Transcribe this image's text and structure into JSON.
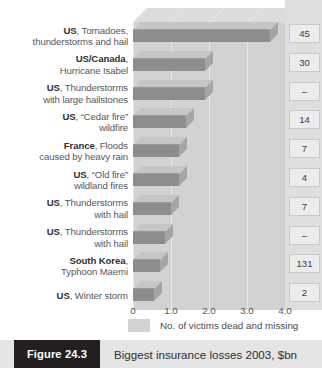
{
  "figure": {
    "tag": "Figure 24.3",
    "title": "Biggest insurance losses 2003, $bn"
  },
  "legend": {
    "swatch_label": "No. of victims dead and missing",
    "swatch_color": "#d2d2d2"
  },
  "colors": {
    "bar_face": "#8d8d8d",
    "bar_top": "#c6c6c6",
    "bar_side": "#a5a5a5",
    "plot_bg": "#d2d2d2",
    "value_col_bg": "#dedede",
    "value_box_bg": "#ececec",
    "caption_bg": "#e4e4e4",
    "tag_bg": "#231f20"
  },
  "chart_data": {
    "type": "bar",
    "orientation": "horizontal",
    "title": "Biggest insurance losses 2003, $bn",
    "xlabel": "",
    "ylabel": "",
    "xlim": [
      0,
      4.0
    ],
    "grid": true,
    "legend_position": "bottom",
    "xticks": [
      "0",
      "1.0",
      "2.0",
      "3.0",
      "4.0"
    ],
    "xtick_values": [
      0,
      1.0,
      2.0,
      3.0,
      4.0
    ],
    "categories": [
      {
        "country": "US",
        "event": ", Tornadoes, thunderstorms and hail"
      },
      {
        "country": "US/Canada",
        "event": ", Hurricane Isabel"
      },
      {
        "country": "US",
        "event": ", Thunderstorms with large hailstones"
      },
      {
        "country": "US",
        "event": ", “Cedar fire” wildfire"
      },
      {
        "country": "France",
        "event": ", Floods caused by heavy rain"
      },
      {
        "country": "US",
        "event": ", “Old fire” wildland fires"
      },
      {
        "country": "US",
        "event": ", Thunderstorms with hail"
      },
      {
        "country": "US",
        "event": ", Thunderstorms with hail"
      },
      {
        "country": "South Korea",
        "event": ", Typhoon Maemi"
      },
      {
        "country": "US",
        "event": ", Winter storm"
      }
    ],
    "category_lines": [
      [
        "US, Tornadoes,",
        "thunderstorms and hail"
      ],
      [
        "US/Canada,",
        "Hurricane Isabel"
      ],
      [
        "US, Thunderstorms",
        "with large hailstones"
      ],
      [
        "US, “Cedar fire”",
        "wildfire"
      ],
      [
        "France, Floods",
        "caused by heavy rain"
      ],
      [
        "US, “Old fire”",
        "wildland fires"
      ],
      [
        "US, Thunderstorms",
        "with hail"
      ],
      [
        "US, Thunderstorms",
        "with hail"
      ],
      [
        "South Korea,",
        "Typhoon Maemi"
      ],
      [
        "US, Winter storm"
      ]
    ],
    "values": [
      3.6,
      1.9,
      1.9,
      1.4,
      1.2,
      1.2,
      1.0,
      0.85,
      0.7,
      0.55
    ],
    "victims": [
      "45",
      "30",
      "–",
      "14",
      "7",
      "4",
      "7",
      "–",
      "131",
      "2"
    ],
    "victims_series_name": "No. of victims dead and missing"
  }
}
